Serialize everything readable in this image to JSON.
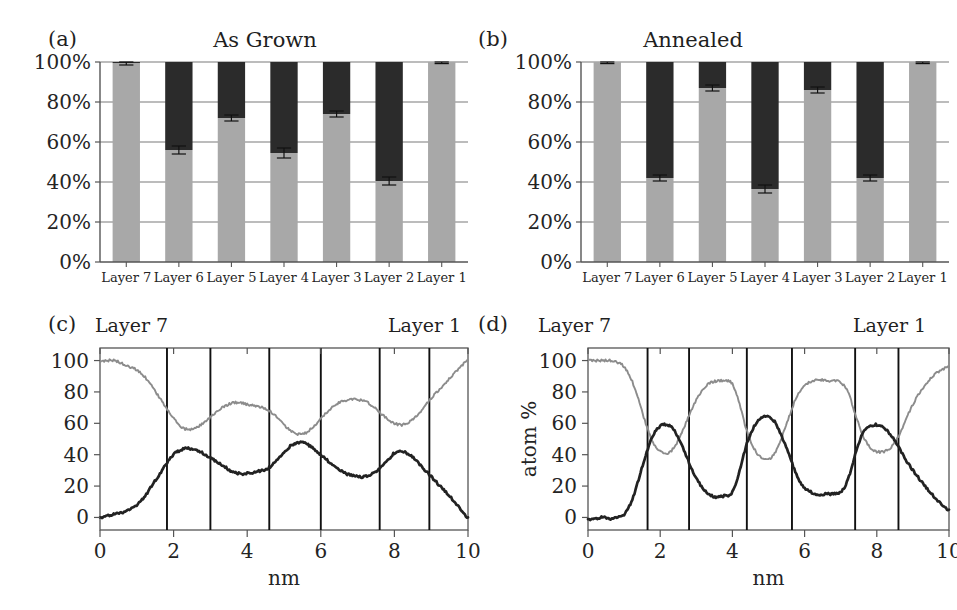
{
  "figure": {
    "width": 957,
    "height": 610,
    "colors": {
      "gray_series": "#a8a8a8",
      "dark_series": "#2b2b2b",
      "axis": "#555555",
      "grid": "#7a7a7a",
      "divider": "#111111",
      "light_curve": "#8c8c8c",
      "dark_curve": "#222222",
      "background": "#ffffff"
    }
  },
  "panels": {
    "a": {
      "tag": "(a)",
      "title": "As Grown",
      "chart_data": {
        "type": "bar",
        "stacked": true,
        "title": "As Grown",
        "xlabel": "",
        "ylabel": "",
        "ylim": [
          0,
          100
        ],
        "yticks": [
          0,
          20,
          40,
          60,
          80,
          100
        ],
        "ytick_labels": [
          "0%",
          "20%",
          "40%",
          "60%",
          "80%",
          "100%"
        ],
        "grid": true,
        "categories": [
          "Layer 7",
          "Layer 6",
          "Layer 5",
          "Layer 4",
          "Layer 3",
          "Layer 2",
          "Layer 1"
        ],
        "series": [
          {
            "name": "gray",
            "values": [
              99.5,
              56,
              72,
              54.5,
              74,
              40.5,
              100
            ]
          },
          {
            "name": "dark",
            "values": [
              0.5,
              44,
              28,
              45.5,
              26,
              59.5,
              0
            ]
          }
        ],
        "errors": [
          1.0,
          2.0,
          1.5,
          2.5,
          1.5,
          2.0,
          0.8
        ]
      }
    },
    "b": {
      "tag": "(b)",
      "title": "Annealed",
      "chart_data": {
        "type": "bar",
        "stacked": true,
        "title": "Annealed",
        "xlabel": "",
        "ylabel": "",
        "ylim": [
          0,
          100
        ],
        "yticks": [
          0,
          20,
          40,
          60,
          80,
          100
        ],
        "ytick_labels": [
          "0%",
          "20%",
          "40%",
          "60%",
          "80%",
          "100%"
        ],
        "grid": true,
        "categories": [
          "Layer 7",
          "Layer 6",
          "Layer 5",
          "Layer 4",
          "Layer 3",
          "Layer 2",
          "Layer 1"
        ],
        "series": [
          {
            "name": "gray",
            "values": [
              100,
              42,
              87,
              36.5,
              86,
              42,
              100
            ]
          },
          {
            "name": "dark",
            "values": [
              0,
              58,
              13,
              63.5,
              14,
              58,
              0
            ]
          }
        ],
        "errors": [
          0.8,
          1.5,
          1.5,
          2.0,
          1.5,
          1.5,
          0.8
        ]
      }
    },
    "c": {
      "tag": "(c)",
      "left_label": "Layer 7",
      "right_label": "Layer 1",
      "chart_data": {
        "type": "line",
        "title": "",
        "xlabel": "nm",
        "ylabel": "",
        "xlim": [
          0,
          10
        ],
        "ylim": [
          -8,
          108
        ],
        "xticks": [
          0,
          2,
          4,
          6,
          8,
          10
        ],
        "yticks": [
          0,
          20,
          40,
          60,
          80,
          100
        ],
        "grid": false,
        "dividers": [
          1.82,
          3.0,
          4.6,
          6.0,
          7.6,
          8.95
        ],
        "series": [
          {
            "name": "light",
            "x": [
              0.0,
              0.2,
              0.4,
              0.6,
              0.8,
              1.0,
              1.2,
              1.4,
              1.6,
              1.8,
              2.0,
              2.2,
              2.4,
              2.6,
              2.8,
              3.0,
              3.2,
              3.4,
              3.6,
              3.8,
              4.0,
              4.2,
              4.4,
              4.6,
              4.8,
              5.0,
              5.2,
              5.4,
              5.6,
              5.8,
              6.0,
              6.2,
              6.4,
              6.6,
              6.8,
              7.0,
              7.2,
              7.4,
              7.6,
              7.8,
              8.0,
              8.2,
              8.4,
              8.6,
              8.8,
              9.0,
              9.2,
              9.4,
              9.6,
              9.8,
              10.0
            ],
            "y": [
              99,
              100,
              100,
              98,
              96,
              94,
              90,
              84,
              77,
              70,
              63,
              58,
              56,
              57,
              60,
              64,
              68,
              71,
              73,
              73,
              72,
              71,
              70,
              68,
              64,
              59,
              55,
              53,
              54,
              58,
              63,
              68,
              72,
              74,
              75,
              75,
              74,
              71,
              67,
              63,
              60,
              59,
              61,
              65,
              70,
              76,
              81,
              86,
              91,
              96,
              100
            ]
          },
          {
            "name": "dark",
            "x": [
              0.0,
              0.2,
              0.4,
              0.6,
              0.8,
              1.0,
              1.2,
              1.4,
              1.6,
              1.8,
              2.0,
              2.2,
              2.4,
              2.6,
              2.8,
              3.0,
              3.2,
              3.4,
              3.6,
              3.8,
              4.0,
              4.2,
              4.4,
              4.6,
              4.8,
              5.0,
              5.2,
              5.4,
              5.6,
              5.8,
              6.0,
              6.2,
              6.4,
              6.6,
              6.8,
              7.0,
              7.2,
              7.4,
              7.6,
              7.8,
              8.0,
              8.2,
              8.4,
              8.6,
              8.8,
              9.0,
              9.2,
              9.4,
              9.6,
              9.8,
              10.0
            ],
            "y": [
              0,
              1,
              2,
              3,
              5,
              8,
              13,
              20,
              27,
              34,
              40,
              43,
              44,
              43,
              41,
              38,
              35,
              32,
              29,
              28,
              28,
              29,
              30,
              32,
              36,
              41,
              46,
              48,
              47,
              44,
              40,
              36,
              32,
              29,
              27,
              26,
              26,
              28,
              31,
              36,
              41,
              42,
              40,
              36,
              31,
              26,
              21,
              16,
              11,
              5,
              0
            ]
          }
        ]
      }
    },
    "d": {
      "tag": "(d)",
      "left_label": "Layer 7",
      "right_label": "Layer 1",
      "chart_data": {
        "type": "line",
        "title": "",
        "xlabel": "nm",
        "ylabel": "atom %",
        "xlim": [
          0,
          10
        ],
        "ylim": [
          -8,
          108
        ],
        "xticks": [
          0,
          2,
          4,
          6,
          8,
          10
        ],
        "yticks": [
          0,
          20,
          40,
          60,
          80,
          100
        ],
        "grid": false,
        "dividers": [
          1.65,
          2.8,
          4.4,
          5.65,
          7.4,
          8.6
        ],
        "series": [
          {
            "name": "light",
            "x": [
              0.0,
              0.2,
              0.4,
              0.6,
              0.8,
              1.0,
              1.2,
              1.4,
              1.6,
              1.8,
              2.0,
              2.2,
              2.4,
              2.6,
              2.8,
              3.0,
              3.2,
              3.4,
              3.6,
              3.8,
              4.0,
              4.2,
              4.4,
              4.6,
              4.8,
              5.0,
              5.2,
              5.4,
              5.6,
              5.8,
              6.0,
              6.2,
              6.4,
              6.6,
              6.8,
              7.0,
              7.2,
              7.4,
              7.6,
              7.8,
              8.0,
              8.2,
              8.4,
              8.6,
              8.8,
              9.0,
              9.2,
              9.4,
              9.6,
              9.8,
              10.0
            ],
            "y": [
              100,
              100,
              100,
              100,
              99,
              96,
              88,
              75,
              60,
              48,
              42,
              41,
              45,
              54,
              65,
              75,
              82,
              86,
              87,
              87,
              85,
              72,
              55,
              44,
              38,
              37,
              42,
              53,
              66,
              78,
              84,
              87,
              88,
              87,
              87,
              86,
              80,
              66,
              53,
              45,
              42,
              42,
              45,
              52,
              62,
              72,
              80,
              86,
              91,
              94,
              96
            ]
          },
          {
            "name": "dark",
            "x": [
              0.0,
              0.2,
              0.4,
              0.6,
              0.8,
              1.0,
              1.2,
              1.4,
              1.6,
              1.8,
              2.0,
              2.2,
              2.4,
              2.6,
              2.8,
              3.0,
              3.2,
              3.4,
              3.6,
              3.8,
              4.0,
              4.2,
              4.4,
              4.6,
              4.8,
              5.0,
              5.2,
              5.4,
              5.6,
              5.8,
              6.0,
              6.2,
              6.4,
              6.6,
              6.8,
              7.0,
              7.2,
              7.4,
              7.6,
              7.8,
              8.0,
              8.2,
              8.4,
              8.6,
              8.8,
              9.0,
              9.2,
              9.4,
              9.6,
              9.8,
              10.0
            ],
            "y": [
              -1,
              -1,
              0,
              -1,
              0,
              2,
              10,
              24,
              40,
              52,
              58,
              59,
              55,
              46,
              35,
              25,
              18,
              14,
              13,
              14,
              16,
              30,
              47,
              58,
              63,
              64,
              60,
              50,
              38,
              26,
              19,
              16,
              14,
              15,
              15,
              16,
              24,
              40,
              53,
              58,
              59,
              57,
              52,
              45,
              37,
              30,
              24,
              18,
              13,
              8,
              5
            ]
          }
        ]
      }
    }
  }
}
